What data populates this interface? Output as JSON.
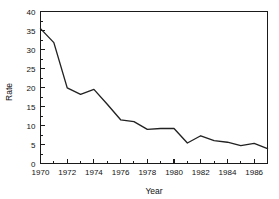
{
  "chart_data": {
    "type": "line",
    "title": "",
    "xlabel": "Year",
    "ylabel": "Rate",
    "xlim": [
      1970,
      1987
    ],
    "ylim": [
      0,
      40
    ],
    "grid": false,
    "legend": null,
    "x_major_ticks": [
      1970,
      1972,
      1974,
      1976,
      1978,
      1980,
      1982,
      1984,
      1986
    ],
    "x_major_tick_labels": [
      "1970",
      "1972",
      "1974",
      "1976",
      "1978",
      "1980",
      "1982",
      "1984",
      "1986"
    ],
    "x_minor_ticks": [
      1971,
      1973,
      1975,
      1977,
      1979,
      1981,
      1983,
      1985,
      1987
    ],
    "y_major_ticks": [
      0,
      5,
      10,
      15,
      20,
      25,
      30,
      35,
      40
    ],
    "y_major_tick_labels": [
      "0",
      "5",
      "10",
      "15",
      "20",
      "25",
      "30",
      "35",
      "40"
    ],
    "x": [
      1970,
      1971,
      1972,
      1973,
      1974,
      1975,
      1976,
      1977,
      1978,
      1979,
      1980,
      1981,
      1982,
      1983,
      1984,
      1985,
      1986,
      1987
    ],
    "values": [
      35.5,
      31.8,
      19.9,
      18.2,
      19.5,
      15.6,
      11.5,
      11.0,
      9.0,
      9.2,
      9.2,
      5.4,
      7.3,
      6.0,
      5.6,
      4.7,
      5.3,
      3.9
    ],
    "series": [
      {
        "name": "Rate",
        "color": "#222222",
        "values": [
          35.5,
          31.8,
          19.9,
          18.2,
          19.5,
          15.6,
          11.5,
          11.0,
          9.0,
          9.2,
          9.2,
          5.4,
          7.3,
          6.0,
          5.6,
          4.7,
          5.3,
          3.9
        ]
      }
    ]
  },
  "axes": {
    "y_title": "Rate",
    "x_title": "Year"
  }
}
